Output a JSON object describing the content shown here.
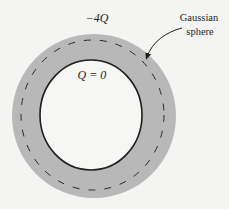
{
  "diagram": {
    "labels": {
      "outer_charge": "−4Q",
      "inner_charge": "Q = 0",
      "gaussian_line1": "Gaussian",
      "gaussian_line2": "sphere"
    },
    "colors": {
      "background": "#f4f4f2",
      "shell_fill": "#b8b8b8",
      "cavity_fill": "#f6f6f4",
      "outline": "#1e1e1e",
      "dashes": "#2a2a2a"
    },
    "shapes": {
      "outer_shell": {
        "cx": 94,
        "cy": 116,
        "rx": 82,
        "ry": 82
      },
      "inner_cavity": {
        "cx": 91,
        "cy": 115,
        "rx": 51,
        "ry": 55
      },
      "gaussian_sphere": {
        "cx": 92.5,
        "cy": 115,
        "rx": 71.5,
        "ry": 75
      }
    }
  }
}
